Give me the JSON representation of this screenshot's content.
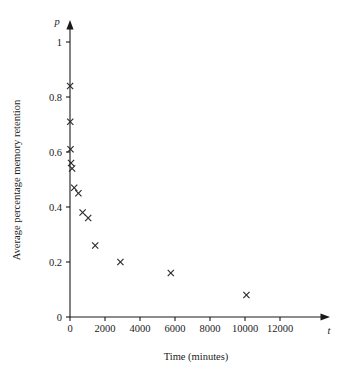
{
  "chart_data": {
    "type": "scatter",
    "title": "",
    "xlabel": "Time (minutes)",
    "ylabel": "Average percentage memory retention",
    "x_axis_symbol": "t",
    "y_axis_symbol": "p",
    "xlim": [
      0,
      13000
    ],
    "ylim": [
      0,
      1.08
    ],
    "grid": false,
    "legend": null,
    "marker_style": "x",
    "marker_color": "#2b2b2b",
    "xticks": [
      0,
      2000,
      4000,
      6000,
      8000,
      10000,
      12000
    ],
    "xticklabels": [
      "0",
      "2000",
      "4000",
      "6000",
      "8000",
      "10000",
      "12000"
    ],
    "yticks": [
      0,
      0.2,
      0.4,
      0.6,
      0.8,
      1
    ],
    "yticklabels": [
      "0",
      "0.2",
      "0.4",
      "0.6",
      "0.8",
      "1"
    ],
    "series": [
      {
        "name": "memory retention",
        "points": [
          {
            "x": 5,
            "y": 0.84
          },
          {
            "x": 15,
            "y": 0.71
          },
          {
            "x": 30,
            "y": 0.61
          },
          {
            "x": 60,
            "y": 0.56
          },
          {
            "x": 120,
            "y": 0.54
          },
          {
            "x": 240,
            "y": 0.47
          },
          {
            "x": 480,
            "y": 0.45
          },
          {
            "x": 720,
            "y": 0.38
          },
          {
            "x": 1040,
            "y": 0.36
          },
          {
            "x": 1440,
            "y": 0.26
          },
          {
            "x": 2880,
            "y": 0.2
          },
          {
            "x": 5760,
            "y": 0.16
          },
          {
            "x": 10080,
            "y": 0.08
          }
        ]
      }
    ]
  },
  "axes": {
    "x_tick_unicode": "",
    "y_tick_unicode": ""
  }
}
